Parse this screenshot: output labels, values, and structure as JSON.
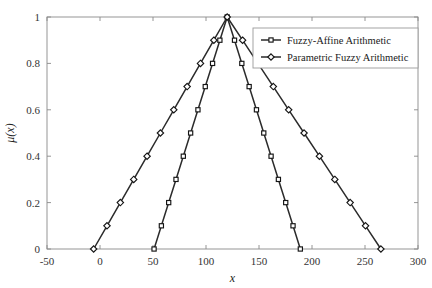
{
  "chart_data": {
    "type": "line",
    "title": "",
    "subtitle": "",
    "xlabel": "x",
    "ylabel": "μ(x)",
    "xlim": [
      -50,
      300
    ],
    "ylim": [
      0,
      1
    ],
    "xticks": [
      -50,
      0,
      50,
      100,
      150,
      200,
      250,
      300
    ],
    "xtick_labels": [
      "-50",
      "0",
      "50",
      "100",
      "150",
      "200",
      "250",
      "300"
    ],
    "yticks": [
      0,
      0.2,
      0.4,
      0.6,
      0.8,
      1
    ],
    "ytick_labels": [
      "0",
      "0.2",
      "0.4",
      "0.6",
      "0.8",
      "1"
    ],
    "grid": false,
    "legend_position": "upper right",
    "marker_interval": 0.1,
    "series": [
      {
        "name": "Fuzzy-Affine Arithmetic",
        "marker": "square",
        "color": "#2b2b2b",
        "shape": "triangular",
        "support": [
          51,
          189
        ],
        "peak": 120,
        "x": [
          51,
          58.9,
          66.8,
          74.7,
          82.6,
          90.5,
          98.4,
          106.3,
          114.2,
          120,
          126.9,
          133.8,
          140.7,
          147.6,
          154.5,
          161.4,
          168.3,
          175.2,
          182.1,
          189
        ],
        "y": [
          0,
          0.1,
          0.2,
          0.3,
          0.4,
          0.5,
          0.6,
          0.7,
          0.8,
          1,
          0.9,
          0.8,
          0.7,
          0.6,
          0.5,
          0.4,
          0.3,
          0.2,
          0.1,
          0
        ],
        "x_left": [
          51,
          57.9,
          64.8,
          71.7,
          78.6,
          85.5,
          92.4,
          99.3,
          106.2,
          113.1,
          120
        ],
        "y_left": [
          0,
          0.1,
          0.2,
          0.3,
          0.4,
          0.5,
          0.6,
          0.7,
          0.8,
          0.9,
          1
        ],
        "x_right": [
          120,
          126.9,
          133.8,
          140.7,
          147.6,
          154.5,
          161.4,
          168.3,
          175.2,
          182.1,
          189
        ],
        "y_right": [
          1,
          0.9,
          0.8,
          0.7,
          0.6,
          0.5,
          0.4,
          0.3,
          0.2,
          0.1,
          0
        ]
      },
      {
        "name": "Parametric Fuzzy Arithmetic",
        "marker": "diamond",
        "color": "#2b2b2b",
        "shape": "triangular",
        "support": [
          -6,
          265
        ],
        "peak": 120,
        "x_left": [
          -6,
          6.6,
          19.2,
          31.8,
          44.4,
          57,
          69.6,
          82.2,
          94.8,
          107.4,
          120
        ],
        "y_left": [
          0,
          0.1,
          0.2,
          0.3,
          0.4,
          0.5,
          0.6,
          0.7,
          0.8,
          0.9,
          1
        ],
        "x_right": [
          120,
          134.5,
          149,
          163.5,
          178,
          192.5,
          207,
          221.5,
          236,
          250.5,
          265
        ],
        "y_right": [
          1,
          0.9,
          0.8,
          0.7,
          0.6,
          0.5,
          0.4,
          0.3,
          0.2,
          0.1,
          0
        ]
      }
    ]
  },
  "legend": {
    "entries": [
      {
        "label": "Fuzzy-Affine Arithmetic",
        "marker": "square"
      },
      {
        "label": "Parametric Fuzzy Arithmetic",
        "marker": "diamond"
      }
    ]
  },
  "axes": {
    "x_title": "x",
    "y_title": "μ(x)"
  }
}
